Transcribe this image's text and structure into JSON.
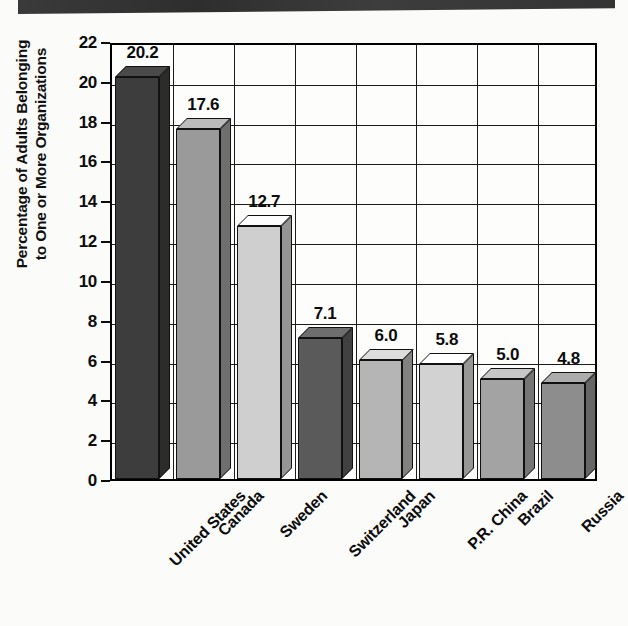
{
  "artifact": {
    "scan_strip_color": "#333333"
  },
  "chart_data": {
    "type": "bar",
    "title": "",
    "subtitle": "",
    "xlabel": "",
    "ylabel": "Percentage of Adults Belonging\nto One or More Organizations",
    "categories": [
      "United States",
      "Canada",
      "Sweden",
      "Switzerland",
      "Japan",
      "P.R. China",
      "Brazil",
      "Russia"
    ],
    "values": [
      20.2,
      17.6,
      12.7,
      7.1,
      6.0,
      5.8,
      5.0,
      4.8
    ],
    "value_labels": [
      "20.2",
      "17.6",
      "12.7",
      "7.1",
      "6.0",
      "5.8",
      "5.0",
      "4.8"
    ],
    "bar_colors": [
      "#3d3d3d",
      "#9a9a9a",
      "#cfcfcf",
      "#5a5a5a",
      "#b5b5b5",
      "#d2d2d2",
      "#a3a3a3",
      "#8d8d8d"
    ],
    "ylim": [
      0,
      22
    ],
    "yticks": [
      0,
      2,
      4,
      6,
      8,
      10,
      12,
      14,
      16,
      18,
      20,
      22
    ],
    "ytick_labels": [
      "0",
      "2",
      "4",
      "6",
      "8",
      "10",
      "12",
      "14",
      "16",
      "18",
      "20",
      "22"
    ],
    "grid": true,
    "legend": "none",
    "style": "3d-bar"
  }
}
